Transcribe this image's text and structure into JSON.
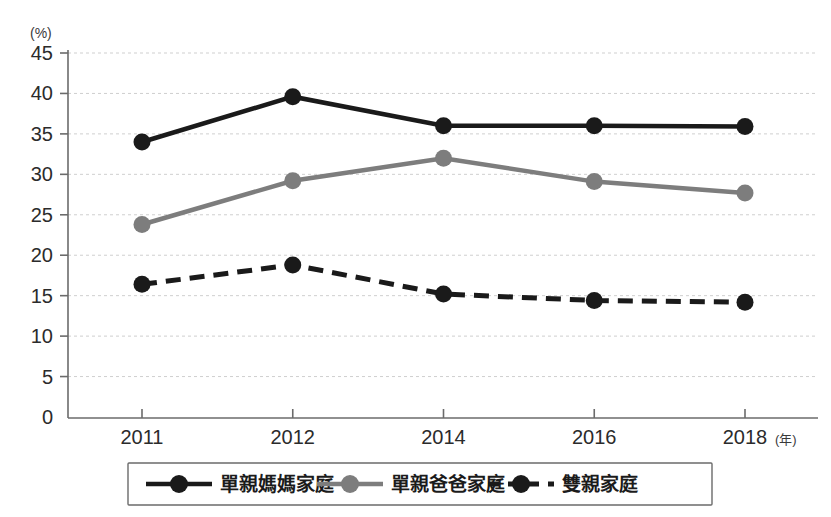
{
  "chart_data": {
    "type": "line",
    "title": "",
    "subtitle": "",
    "xlabel": "(年)",
    "ylabel": "(%)",
    "x": [
      "2011",
      "2012",
      "2014",
      "2016",
      "2018"
    ],
    "categories": [
      "2011",
      "2012",
      "2014",
      "2016",
      "2018"
    ],
    "ylim": [
      0,
      45
    ],
    "yticks": [
      "0",
      "5",
      "10",
      "15",
      "20",
      "25",
      "30",
      "35",
      "40",
      "45"
    ],
    "ytick_values": [
      0,
      5,
      10,
      15,
      20,
      25,
      30,
      35,
      40,
      45
    ],
    "grid": "horizontal-dashed",
    "legend_position": "bottom",
    "series": [
      {
        "name": "單親媽媽家庭",
        "values": [
          34.0,
          39.6,
          36.0,
          36.0,
          35.9
        ],
        "color": "#1a1a1a",
        "style": "solid",
        "marker": "circle"
      },
      {
        "name": "單親爸爸家庭",
        "values": [
          23.8,
          29.2,
          32.0,
          29.1,
          27.7
        ],
        "color": "#7d7d7d",
        "style": "solid",
        "marker": "circle"
      },
      {
        "name": "雙親家庭",
        "values": [
          16.4,
          18.8,
          15.2,
          14.4,
          14.2
        ],
        "color": "#1a1a1a",
        "style": "dashed",
        "marker": "circle"
      }
    ]
  },
  "axes": {
    "y_unit_label": "(%)",
    "x_unit_label": "(年)"
  },
  "legend": {
    "items": [
      {
        "label": "單親媽媽家庭",
        "color": "#1a1a1a",
        "style": "solid"
      },
      {
        "label": "單親爸爸家庭",
        "color": "#7d7d7d",
        "style": "solid"
      },
      {
        "label": "雙親家庭",
        "color": "#1a1a1a",
        "style": "dashed"
      }
    ]
  }
}
